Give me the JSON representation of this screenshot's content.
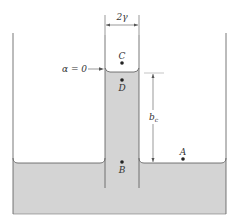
{
  "diagram": {
    "labels": {
      "width_dimension": "2γ",
      "contact_angle": "α = 0",
      "height_dimension_main": "b",
      "height_dimension_sub": "c",
      "point_c": "C",
      "point_d": "D",
      "point_b": "B",
      "point_a": "A"
    },
    "colors": {
      "liquid_fill": "#d4d4d4",
      "lines": "#555555",
      "background": "#ffffff"
    }
  }
}
